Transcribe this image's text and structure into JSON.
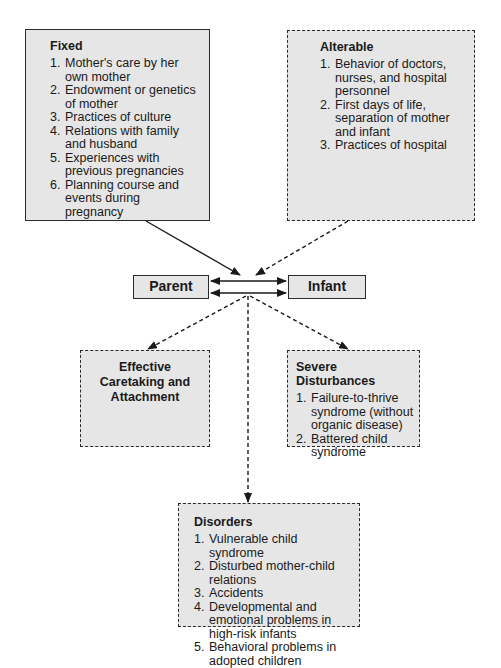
{
  "fixed": {
    "title": "Fixed",
    "items": [
      {
        "n": "1.",
        "text": "Mother's care by her own mother"
      },
      {
        "n": "2.",
        "text": "Endowment or genetics of mother"
      },
      {
        "n": "3.",
        "text": "Practices of culture"
      },
      {
        "n": "4.",
        "text": "Relations with family and husband"
      },
      {
        "n": "5.",
        "text": "Experiences with previous pregnancies"
      },
      {
        "n": "6.",
        "text": "Planning course and events during pregnancy"
      }
    ]
  },
  "alterable": {
    "title": "Alterable",
    "items": [
      {
        "n": "1.",
        "text": "Behavior of doctors, nurses, and hospital personnel"
      },
      {
        "n": "2.",
        "text": "First days of life, separation of mother and infant"
      },
      {
        "n": "3.",
        "text": "Practices of hospital"
      }
    ]
  },
  "parent": {
    "label": "Parent"
  },
  "infant": {
    "label": "Infant"
  },
  "effective": {
    "title": "Effective Caretaking and Attachment"
  },
  "severe": {
    "title": "Severe Disturbances",
    "items": [
      {
        "n": "1.",
        "text": "Failure-to-thrive syndrome (without organic disease)"
      },
      {
        "n": "2.",
        "text": "Battered child syndrome"
      }
    ]
  },
  "disorders": {
    "title": "Disorders",
    "items": [
      {
        "n": "1.",
        "text": "Vulnerable child syndrome"
      },
      {
        "n": "2.",
        "text": "Disturbed mother-child relations"
      },
      {
        "n": "3.",
        "text": "Accidents"
      },
      {
        "n": "4.",
        "text": "Developmental and emotional problems in high-risk infants"
      },
      {
        "n": "5.",
        "text": "Behavioral problems in adopted children"
      }
    ]
  },
  "colors": {
    "box_fill": "#e6e6e6",
    "line": "#2a2a2a"
  }
}
